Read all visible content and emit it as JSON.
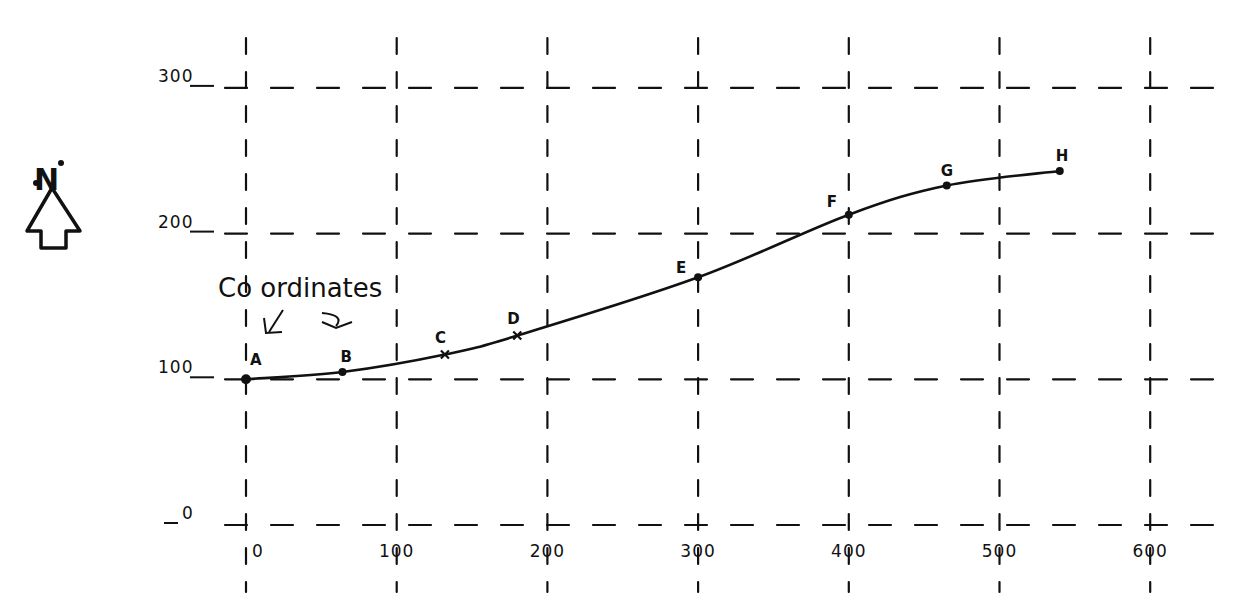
{
  "diagram": {
    "type": "coordinate-traverse-sketch",
    "north_arrow": {
      "label": "N"
    },
    "annotation": {
      "text": "Co ordinates",
      "arrows": 2
    },
    "x_axis": {
      "ticks": [
        0,
        100,
        200,
        300,
        400,
        500,
        600
      ],
      "tick_labels": [
        "0",
        "100",
        "200",
        "300",
        "400",
        "500",
        "600"
      ]
    },
    "y_axis": {
      "ticks": [
        0,
        100,
        200,
        300
      ],
      "tick_labels": [
        "0",
        "100",
        "200",
        "300"
      ]
    },
    "grid": {
      "style": "dashed",
      "color": "#111111"
    },
    "curve_color": "#111111",
    "points": [
      {
        "label": "A",
        "x": 0,
        "y": 100,
        "marker": "dot"
      },
      {
        "label": "B",
        "x": 64,
        "y": 105,
        "marker": "dot"
      },
      {
        "label": "C",
        "x": 132,
        "y": 117,
        "marker": "cross"
      },
      {
        "label": "D",
        "x": 180,
        "y": 130,
        "marker": "cross"
      },
      {
        "label": "E",
        "x": 300,
        "y": 170,
        "marker": "dot"
      },
      {
        "label": "F",
        "x": 400,
        "y": 213,
        "marker": "dot"
      },
      {
        "label": "G",
        "x": 465,
        "y": 233,
        "marker": "dot"
      },
      {
        "label": "H",
        "x": 540,
        "y": 243,
        "marker": "dot"
      }
    ]
  },
  "chart_data": {
    "type": "line",
    "title": "",
    "xlabel": "",
    "ylabel": "",
    "x": [
      0,
      64,
      132,
      180,
      300,
      400,
      465,
      540
    ],
    "series": [
      {
        "name": "traverse",
        "labels": [
          "A",
          "B",
          "C",
          "D",
          "E",
          "F",
          "G",
          "H"
        ],
        "values": [
          100,
          105,
          117,
          130,
          170,
          213,
          233,
          243
        ]
      }
    ],
    "xlim": [
      0,
      600
    ],
    "ylim": [
      0,
      300
    ],
    "grid": true,
    "legend": "none",
    "annotations": [
      "N (north arrow)",
      "Co ordinates"
    ]
  }
}
